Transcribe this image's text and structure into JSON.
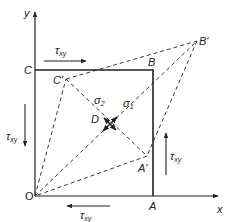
{
  "diagram": {
    "type": "shear strain element deformation",
    "axes": {
      "x_label": "x",
      "y_label": "y",
      "origin_label": "O"
    },
    "points": {
      "O": {
        "label": "O"
      },
      "A": {
        "label": "A"
      },
      "B": {
        "label": "B"
      },
      "C": {
        "label": "C"
      },
      "A_prime": {
        "label": "A'"
      },
      "B_prime": {
        "label": "B'"
      },
      "C_prime": {
        "label": "C'"
      },
      "D": {
        "label": "D"
      }
    },
    "stresses": {
      "top": {
        "symbol": "τ",
        "sub": "xy",
        "direction": "right"
      },
      "bottom": {
        "symbol": "τ",
        "sub": "xy",
        "direction": "left"
      },
      "left": {
        "symbol": "τ",
        "sub": "xy",
        "direction": "down"
      },
      "right": {
        "symbol": "τ",
        "sub": "xy",
        "direction": "up"
      },
      "sigma1": {
        "symbol": "σ",
        "sub": "1"
      },
      "sigma2": {
        "symbol": "σ",
        "sub": "2"
      }
    },
    "colors": {
      "line": "#222222",
      "background": "#ffffff"
    }
  }
}
